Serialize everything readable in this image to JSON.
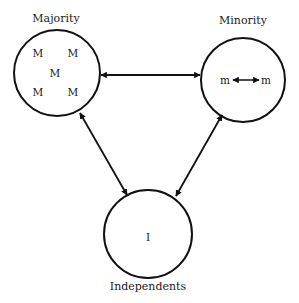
{
  "diagram": {
    "type": "influence-triangle",
    "colors": {
      "stroke": "#111111",
      "text": "#1a1a1a",
      "background": "#ffffff"
    },
    "nodes": {
      "majority": {
        "label": "Majority",
        "members": [
          "M",
          "M",
          "M",
          "M",
          "M"
        ]
      },
      "minority": {
        "label": "Minority",
        "members": [
          "m",
          "m"
        ],
        "internal_link": "bidirectional"
      },
      "independents": {
        "label": "Independents",
        "members": [
          "I"
        ]
      }
    },
    "edges": [
      {
        "from": "Majority",
        "to": "Minority",
        "direction": "bidirectional"
      },
      {
        "from": "Majority",
        "to": "Independents",
        "direction": "bidirectional"
      },
      {
        "from": "Minority",
        "to": "Independents",
        "direction": "bidirectional"
      }
    ]
  }
}
